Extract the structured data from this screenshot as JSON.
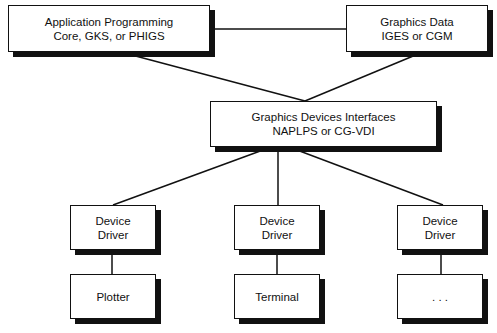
{
  "diagram": {
    "nodes": {
      "app": {
        "line1": "Application Programming",
        "line2": "Core, GKS, or PHIGS"
      },
      "gdata": {
        "line1": "Graphics Data",
        "line2": "IGES or CGM"
      },
      "gdi": {
        "line1": "Graphics Devices Interfaces",
        "line2": "NAPLPS or CG-VDI"
      },
      "dd1": {
        "line1": "Device",
        "line2": "Driver"
      },
      "dd2": {
        "line1": "Device",
        "line2": "Driver"
      },
      "dd3": {
        "line1": "Device",
        "line2": "Driver"
      },
      "out1": {
        "label": "Plotter"
      },
      "out2": {
        "label": "Terminal"
      },
      "out3": {
        "label": ". . ."
      }
    },
    "edges": [
      [
        "app",
        "gdata"
      ],
      [
        "app",
        "gdi"
      ],
      [
        "gdata",
        "gdi"
      ],
      [
        "gdi",
        "dd1"
      ],
      [
        "gdi",
        "dd2"
      ],
      [
        "gdi",
        "dd3"
      ],
      [
        "dd1",
        "out1"
      ],
      [
        "dd2",
        "out2"
      ],
      [
        "dd3",
        "out3"
      ]
    ]
  }
}
